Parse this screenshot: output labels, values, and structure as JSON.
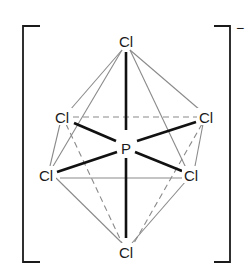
{
  "diagram": {
    "title": "",
    "type": "octahedral molecular geometry",
    "charge": "−",
    "central_atom": {
      "label": "P",
      "x": 126,
      "y": 148
    },
    "ligands": [
      {
        "id": "top",
        "label": "Cl",
        "x": 126,
        "y": 42
      },
      {
        "id": "upper_left",
        "label": "Cl",
        "x": 62,
        "y": 116
      },
      {
        "id": "upper_right",
        "label": "Cl",
        "x": 206,
        "y": 116
      },
      {
        "id": "lower_left",
        "label": "Cl",
        "x": 46,
        "y": 175
      },
      {
        "id": "lower_right",
        "label": "Cl",
        "x": 191,
        "y": 175
      },
      {
        "id": "bottom",
        "label": "Cl",
        "x": 126,
        "y": 252
      }
    ],
    "bonds": [
      [
        "P",
        "top"
      ],
      [
        "P",
        "bottom"
      ],
      [
        "P",
        "upper_left"
      ],
      [
        "P",
        "upper_right"
      ],
      [
        "P",
        "lower_left"
      ],
      [
        "P",
        "lower_right"
      ]
    ],
    "solid_edges": [
      [
        "top",
        "upper_left"
      ],
      [
        "top",
        "upper_right"
      ],
      [
        "top",
        "lower_left"
      ],
      [
        "top",
        "lower_right"
      ],
      [
        "bottom",
        "lower_left"
      ],
      [
        "bottom",
        "lower_right"
      ],
      [
        "lower_left",
        "lower_right"
      ],
      [
        "upper_left",
        "lower_left"
      ],
      [
        "upper_right",
        "lower_right"
      ]
    ],
    "dashed_edges": [
      [
        "upper_left",
        "upper_right"
      ],
      [
        "bottom",
        "upper_left"
      ],
      [
        "bottom",
        "upper_right"
      ]
    ],
    "bracket_color": "#1a1a1a",
    "bond_color": "#111111",
    "edge_color": "#8a8a8a"
  }
}
